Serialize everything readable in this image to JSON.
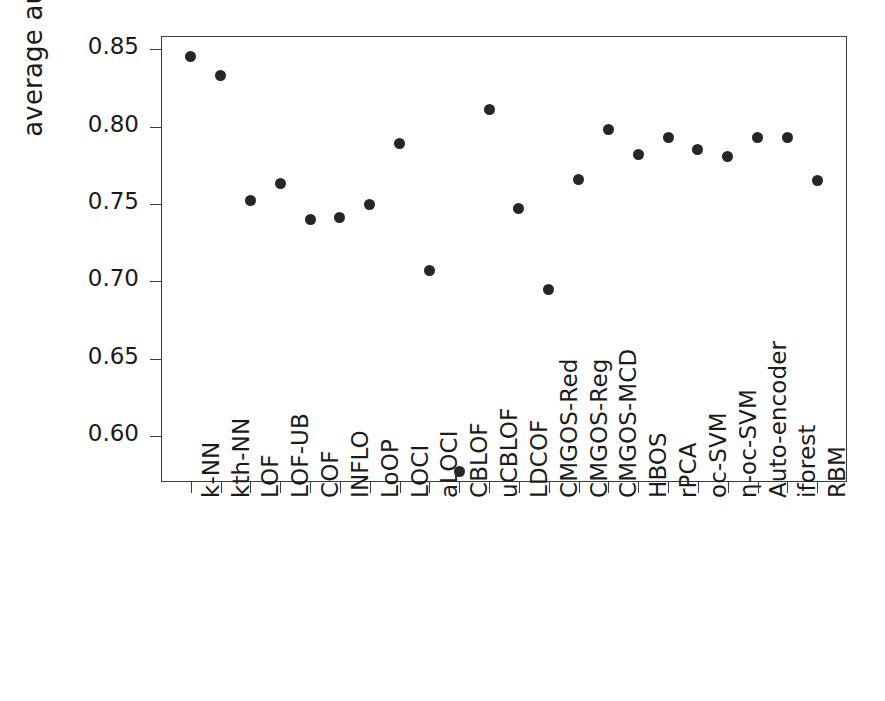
{
  "chart_data": {
    "type": "scatter",
    "title": "",
    "xlabel": "",
    "ylabel": "average auc",
    "ylim": [
      0.5705,
      0.8585
    ],
    "yticks": [
      0.6,
      0.65,
      0.7,
      0.75,
      0.8,
      0.85
    ],
    "ytick_labels": [
      "0.60",
      "0.65",
      "0.70",
      "0.75",
      "0.80",
      "0.85"
    ],
    "grid": false,
    "legend": null,
    "marker": "filled-circle",
    "marker_color": "#262626",
    "categories": [
      "k-NN",
      "kth-NN",
      "LOF",
      "LOF-UB",
      "COF",
      "INFLO",
      "LoOP",
      "LOCI",
      "aLOCI",
      "CBLOF",
      "uCBLOF",
      "LDCOF",
      "CMGOS-Red",
      "CMGOS-Reg",
      "CMGOS-MCD",
      "HBOS",
      "rPCA",
      "oc-SVM",
      "η-oc-SVM",
      "Auto-encoder",
      "iforest",
      "RBM"
    ],
    "values": [
      0.845,
      0.833,
      0.752,
      0.763,
      0.74,
      0.741,
      0.75,
      0.789,
      0.707,
      0.577,
      0.811,
      0.747,
      0.695,
      0.766,
      0.798,
      0.782,
      0.793,
      0.785,
      0.781,
      0.793,
      0.793,
      0.765
    ]
  },
  "axes": {
    "y_title": "average auc"
  }
}
